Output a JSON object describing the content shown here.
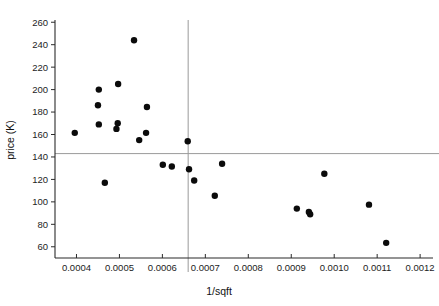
{
  "chart_data": {
    "type": "scatter",
    "title": "",
    "xlabel": "1/sqft",
    "ylabel": "price (K)",
    "xlim": [
      0.00035,
      0.00123
    ],
    "ylim": [
      50,
      262
    ],
    "grid": false,
    "legend": null,
    "x_ticks": [
      0.0004,
      0.0005,
      0.0006,
      0.0007,
      0.0008,
      0.0009,
      0.001,
      0.0011,
      0.0012
    ],
    "x_tick_labels": [
      "0.0004",
      "0.0005",
      "0.0006",
      "0.0007",
      "0.0008",
      "0.0009",
      "0.0010",
      "0.0011",
      "0.0012"
    ],
    "y_ticks": [
      60,
      80,
      100,
      120,
      140,
      160,
      180,
      200,
      220,
      240,
      260
    ],
    "y_tick_labels": [
      "60",
      "80",
      "100",
      "120",
      "140",
      "160",
      "180",
      "200",
      "220",
      "240",
      "260"
    ],
    "reference_lines": [
      {
        "orientation": "vertical",
        "value": 0.00066,
        "color": "#9a9a9a"
      },
      {
        "orientation": "horizontal",
        "value": 143,
        "color": "#9a9a9a"
      }
    ],
    "marker": {
      "shape": "circle",
      "color": "#0b0b0b",
      "size": 4.2
    },
    "points": [
      {
        "x": 0.000396,
        "y": 161.5
      },
      {
        "x": 0.000452,
        "y": 200.0
      },
      {
        "x": 0.00045,
        "y": 186.0
      },
      {
        "x": 0.000452,
        "y": 169.0
      },
      {
        "x": 0.000466,
        "y": 117.0
      },
      {
        "x": 0.000497,
        "y": 205.0
      },
      {
        "x": 0.000496,
        "y": 170.0
      },
      {
        "x": 0.000493,
        "y": 165.0
      },
      {
        "x": 0.000534,
        "y": 244.0
      },
      {
        "x": 0.000546,
        "y": 155.0
      },
      {
        "x": 0.000564,
        "y": 184.5
      },
      {
        "x": 0.000562,
        "y": 161.5
      },
      {
        "x": 0.000601,
        "y": 133.0
      },
      {
        "x": 0.000622,
        "y": 131.5
      },
      {
        "x": 0.000659,
        "y": 154.0
      },
      {
        "x": 0.000662,
        "y": 129.0
      },
      {
        "x": 0.000674,
        "y": 119.0
      },
      {
        "x": 0.000722,
        "y": 105.5
      },
      {
        "x": 0.000739,
        "y": 134.0
      },
      {
        "x": 0.000913,
        "y": 94.0
      },
      {
        "x": 0.000941,
        "y": 91.0
      },
      {
        "x": 0.000944,
        "y": 89.0
      },
      {
        "x": 0.000977,
        "y": 125.0
      },
      {
        "x": 0.001081,
        "y": 97.5
      },
      {
        "x": 0.001121,
        "y": 63.5
      }
    ]
  }
}
